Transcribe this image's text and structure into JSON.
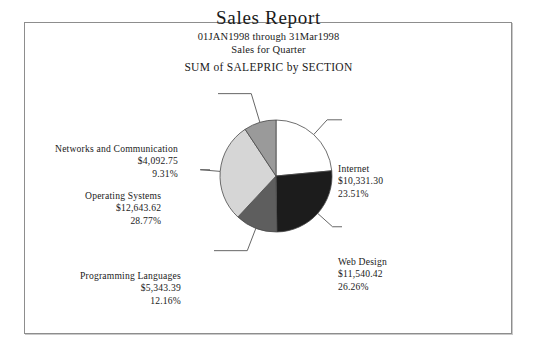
{
  "header": {
    "title": "Sales Report",
    "date_range": "01JAN1998 through 31Mar1998",
    "period": "Sales for Quarter",
    "measure": "SUM of SALEPRIC by SECTION"
  },
  "chart_data": {
    "type": "pie",
    "title": "Sales Report",
    "subtitle": "01JAN1998 through 31Mar1998",
    "measure": "SUM of SALEPRIC by SECTION",
    "value_prefix": "$",
    "total_value": 43951.48,
    "legend": "none",
    "labels_position": "outside-with-leader-lines",
    "start_angle_deg": 0,
    "direction": "clockwise",
    "categories": [
      "Internet",
      "Web Design",
      "Programming Languages",
      "Operating Systems",
      "Networks and Communication"
    ],
    "values": [
      10331.3,
      11540.42,
      5343.39,
      12643.62,
      4092.75
    ],
    "percents": [
      23.51,
      26.26,
      12.16,
      28.77,
      9.31
    ],
    "colors": [
      "#ffffff",
      "#1c1c1c",
      "#5e5e5e",
      "#d6d6d6",
      "#9a9a9a"
    ],
    "slices": [
      {
        "name": "Internet",
        "value_text": "$10,331.30",
        "percent_text": "23.51%",
        "value": 10331.3,
        "percent": 23.51,
        "color": "#ffffff"
      },
      {
        "name": "Web Design",
        "value_text": "$11,540.42",
        "percent_text": "26.26%",
        "value": 11540.42,
        "percent": 26.26,
        "color": "#1c1c1c"
      },
      {
        "name": "Programming Languages",
        "value_text": "$5,343.39",
        "percent_text": "12.16%",
        "value": 5343.39,
        "percent": 12.16,
        "color": "#5e5e5e"
      },
      {
        "name": "Operating Systems",
        "value_text": "$12,643.62",
        "percent_text": "28.77%",
        "value": 12643.62,
        "percent": 28.77,
        "color": "#d6d6d6"
      },
      {
        "name": "Networks and Communication",
        "value_text": "$4,092.75",
        "percent_text": "9.31%",
        "value": 4092.75,
        "percent": 9.31,
        "color": "#9a9a9a"
      }
    ]
  }
}
